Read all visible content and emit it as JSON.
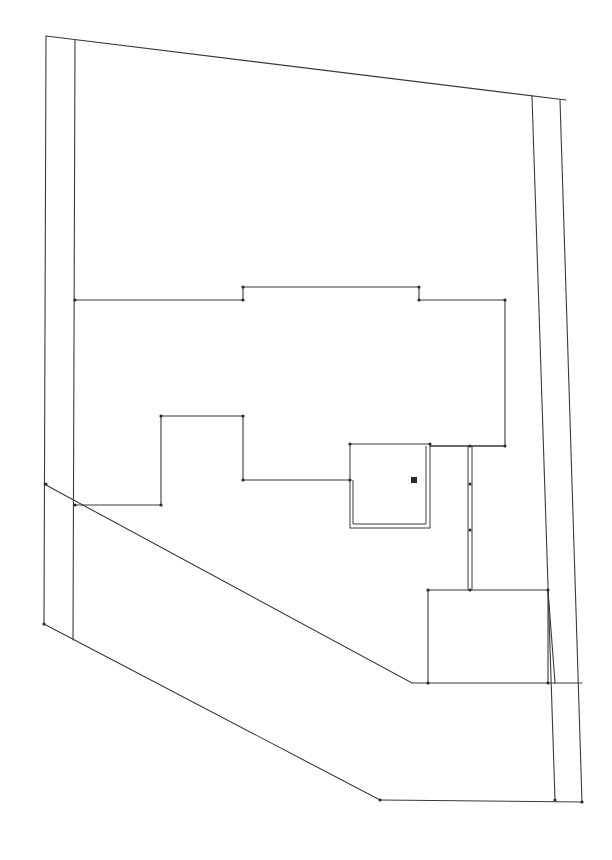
{
  "drawing": {
    "type": "site-plan-line-drawing",
    "stroke_color": "#3a3a3a",
    "background": "#ffffff",
    "polylines": [
      {
        "name": "property-top-edge",
        "points": [
          [
            46,
            36
          ],
          [
            566,
            100
          ]
        ]
      },
      {
        "name": "property-left-outer",
        "points": [
          [
            46,
            36
          ],
          [
            44,
            624
          ]
        ]
      },
      {
        "name": "property-left-inner",
        "points": [
          [
            75,
            40
          ],
          [
            73,
            640
          ]
        ]
      },
      {
        "name": "property-right-outer",
        "points": [
          [
            560,
            100
          ],
          [
            582,
            802
          ]
        ]
      },
      {
        "name": "property-right-inner",
        "points": [
          [
            532,
            96
          ],
          [
            555,
            800
          ]
        ]
      },
      {
        "name": "property-bottom-diagonal",
        "points": [
          [
            44,
            624
          ],
          [
            380,
            800
          ]
        ]
      },
      {
        "name": "property-bottom-edge",
        "points": [
          [
            380,
            800
          ],
          [
            582,
            802
          ]
        ]
      },
      {
        "name": "setback-diagonal",
        "points": [
          [
            44,
            484
          ],
          [
            412,
            683
          ],
          [
            582,
            683
          ]
        ]
      },
      {
        "name": "building-upper-outline",
        "points": [
          [
            75,
            300
          ],
          [
            243,
            300
          ],
          [
            243,
            287
          ],
          [
            419,
            287
          ],
          [
            419,
            300
          ],
          [
            505,
            300
          ],
          [
            505,
            446
          ],
          [
            430,
            446
          ]
        ]
      },
      {
        "name": "building-lower-outline",
        "points": [
          [
            75,
            505
          ],
          [
            161,
            505
          ],
          [
            161,
            416
          ],
          [
            243,
            416
          ],
          [
            243,
            480
          ],
          [
            350,
            480
          ]
        ]
      },
      {
        "name": "annex-outline",
        "points": [
          [
            428,
            590
          ],
          [
            548,
            590
          ],
          [
            548,
            683
          ]
        ]
      },
      {
        "name": "annex-left-wall",
        "points": [
          [
            428,
            590
          ],
          [
            428,
            683
          ]
        ]
      },
      {
        "name": "annex-right-diagonal",
        "points": [
          [
            548,
            590
          ],
          [
            555,
            683
          ]
        ]
      }
    ],
    "double_walls": [
      {
        "name": "garage-box",
        "rect": [
          350,
          444,
          80,
          84
        ]
      },
      {
        "name": "connector-wall",
        "x": 470,
        "y1": 446,
        "y2": 590
      }
    ],
    "vertices": [
      [
        75,
        300
      ],
      [
        243,
        300
      ],
      [
        243,
        287
      ],
      [
        419,
        287
      ],
      [
        419,
        300
      ],
      [
        505,
        300
      ],
      [
        505,
        446
      ],
      [
        75,
        505
      ],
      [
        161,
        505
      ],
      [
        161,
        416
      ],
      [
        243,
        416
      ],
      [
        243,
        480
      ],
      [
        350,
        480
      ],
      [
        350,
        444
      ],
      [
        430,
        444
      ],
      [
        470,
        446
      ],
      [
        470,
        484
      ],
      [
        470,
        530
      ],
      [
        470,
        590
      ],
      [
        428,
        590
      ],
      [
        548,
        590
      ],
      [
        428,
        683
      ],
      [
        548,
        683
      ],
      [
        44,
        624
      ],
      [
        46,
        484
      ],
      [
        380,
        800
      ],
      [
        582,
        802
      ],
      [
        555,
        800
      ]
    ],
    "marker": {
      "name": "center-mark",
      "x": 414,
      "y": 480
    }
  }
}
